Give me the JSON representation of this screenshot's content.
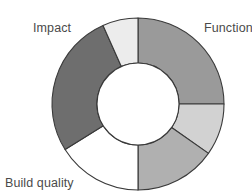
{
  "chart_data": {
    "type": "pie",
    "variant": "donut",
    "title": "",
    "center": [
      138,
      104
    ],
    "outer_radius": 86,
    "inner_radius": 41,
    "start_angle_deg": 0,
    "direction": "clockwise",
    "segments": [
      {
        "label": "Function",
        "start_deg": 0,
        "end_deg": 90,
        "share_pct": 25.0,
        "color": "#9a9a9a"
      },
      {
        "label": "",
        "start_deg": 90,
        "end_deg": 125,
        "share_pct": 9.7,
        "color": "#d2d2d2"
      },
      {
        "label": "",
        "start_deg": 125,
        "end_deg": 180,
        "share_pct": 15.3,
        "color": "#b0b0b0"
      },
      {
        "label": "Build quality",
        "start_deg": 180,
        "end_deg": 238,
        "share_pct": 16.1,
        "color": "#ffffff"
      },
      {
        "label": "Impact",
        "start_deg": 238,
        "end_deg": 336,
        "share_pct": 27.2,
        "color": "#6e6e6e"
      },
      {
        "label": "",
        "start_deg": 336,
        "end_deg": 360,
        "share_pct": 6.7,
        "color": "#ececec"
      }
    ],
    "labels": {
      "impact": "Impact",
      "function": "Function",
      "build_quality": "Build quality"
    },
    "legend": "none",
    "stroke_color": "#3a3a3a"
  }
}
